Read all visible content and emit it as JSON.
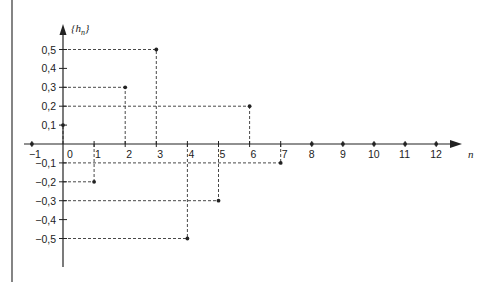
{
  "chart_data": {
    "type": "scatter",
    "title": "",
    "xlabel": "n",
    "ylabel": "{h_n}",
    "ylabel_parts": {
      "open": "{",
      "base": "h",
      "sub": "n",
      "close": "}"
    },
    "x": [
      -1,
      0,
      1,
      2,
      3,
      4,
      5,
      6,
      7,
      8,
      9,
      10,
      11,
      12
    ],
    "values": [
      0,
      0.1,
      -0.2,
      0.3,
      0.5,
      -0.5,
      -0.3,
      0.2,
      -0.1,
      0,
      0,
      0,
      0,
      0
    ],
    "xlim": [
      -1,
      12
    ],
    "ylim": [
      -0.5,
      0.5
    ],
    "x_ticks": [
      -1,
      0,
      1,
      2,
      3,
      4,
      5,
      6,
      7,
      8,
      9,
      10,
      11,
      12
    ],
    "x_tick_labels": [
      "−1",
      "0",
      "1",
      "2",
      "3",
      "4",
      "5",
      "6",
      "7",
      "8",
      "9",
      "10",
      "11",
      "12"
    ],
    "y_ticks": [
      0.5,
      0.4,
      0.3,
      0.2,
      0.1,
      -0.1,
      -0.2,
      -0.3,
      -0.4,
      -0.5
    ],
    "y_tick_labels": [
      "0,5",
      "0,4",
      "0,3",
      "0,2",
      "0,1",
      "−0,1",
      "−0,2",
      "−0,3",
      "−0,4",
      "−0,5"
    ],
    "grid": false,
    "guides": "dashed lines from each nonzero point to both axes",
    "legend": null
  },
  "colors": {
    "ink": "#222222",
    "background": "#ffffff"
  }
}
